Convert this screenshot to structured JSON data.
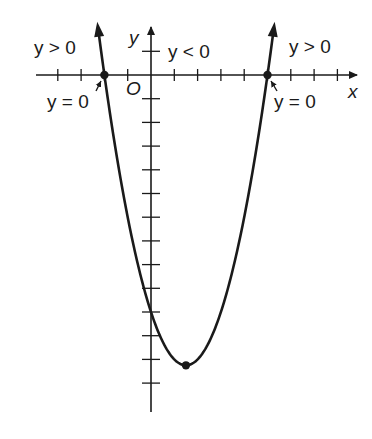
{
  "diagram": {
    "type": "parabola-sign-chart",
    "function": "y = x^2 - 3x - 10",
    "roots": [
      -2,
      5
    ],
    "vertex": {
      "x": 1.5,
      "y": -12.25
    },
    "y_intercept": -10,
    "x_ticks": [
      -4,
      -3,
      -2,
      -1,
      1,
      2,
      3,
      4,
      5,
      6,
      7,
      8
    ],
    "y_ticks": [
      1,
      -1,
      -2,
      -3,
      -4,
      -5,
      -6,
      -7,
      -8,
      -9,
      -10,
      -11,
      -12,
      -13
    ],
    "colors": {
      "ink": "#1a1a1a",
      "background": "#ffffff"
    }
  },
  "labels": {
    "x_axis": "x",
    "y_axis": "y",
    "origin": "O",
    "left_region": "y > 0",
    "middle_region": "y < 0",
    "right_region": "y > 0",
    "left_root": "y = 0",
    "right_root": "y = 0"
  }
}
